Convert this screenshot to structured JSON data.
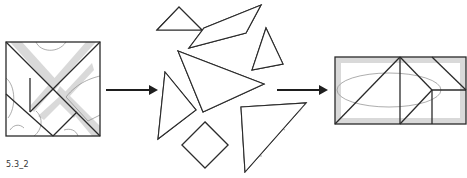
{
  "figure": {
    "caption": "5.3_2",
    "stages": [
      {
        "name": "original-square",
        "label": ""
      },
      {
        "name": "scattered-pieces",
        "label": ""
      },
      {
        "name": "assembled-rectangle",
        "label": ""
      }
    ],
    "arrows": [
      {
        "from": "original-square",
        "to": "scattered-pieces"
      },
      {
        "from": "scattered-pieces",
        "to": "assembled-rectangle"
      }
    ],
    "colors": {
      "outline": "#2a2a2a",
      "shade": "#d9d9d9",
      "inner_curve": "#8a8a8a",
      "arrow": "#1e1e1e"
    },
    "piece_count": 7
  }
}
